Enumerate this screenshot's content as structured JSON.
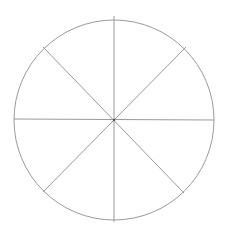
{
  "diagram": {
    "type": "divided-circle",
    "sectors": 8,
    "center": [
      114,
      120
    ],
    "radius": 100,
    "stroke_color": "#9a9a9a",
    "stroke_width": 1,
    "background": "#ffffff",
    "lines": [
      {
        "name": "vertical",
        "x1": 114,
        "y1": 16,
        "x2": 114,
        "y2": 222
      },
      {
        "name": "horizontal",
        "x1": 14,
        "y1": 119,
        "x2": 214,
        "y2": 120
      },
      {
        "name": "diagonal-tl-br",
        "x1": 43,
        "y1": 47,
        "x2": 184,
        "y2": 193
      },
      {
        "name": "diagonal-tr-bl",
        "x1": 186,
        "y1": 47,
        "x2": 43,
        "y2": 192
      }
    ]
  }
}
